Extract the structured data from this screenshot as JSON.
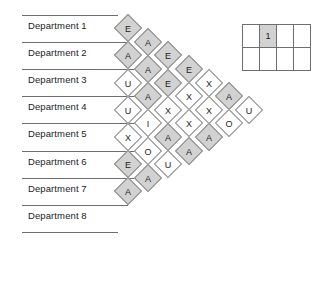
{
  "diagram": {
    "type": "activity-relationship-chart",
    "title": "",
    "departments": [
      {
        "label": "Department 1"
      },
      {
        "label": "Department 2"
      },
      {
        "label": "Department 3"
      },
      {
        "label": "Department 4"
      },
      {
        "label": "Department 5"
      },
      {
        "label": "Department 6"
      },
      {
        "label": "Department 7"
      },
      {
        "label": "Department 8"
      }
    ],
    "colors": {
      "shaded_cell": "#d2d2d2",
      "plain_cell": "#ffffff",
      "cell_border": "#8a8a8a",
      "rule": "#6e6e6e",
      "text": "#1c1c1c"
    },
    "columns": [
      {
        "index": 1,
        "offset": 1,
        "cells": [
          {
            "code": "E",
            "shaded": true,
            "pair": "1-2"
          },
          {
            "code": "A",
            "shaded": true,
            "pair": "2-3"
          },
          {
            "code": "U",
            "shaded": false,
            "pair": "3-4"
          },
          {
            "code": "U",
            "shaded": false,
            "pair": "4-5"
          },
          {
            "code": "X",
            "shaded": false,
            "pair": "5-6"
          },
          {
            "code": "E",
            "shaded": true,
            "pair": "6-7"
          },
          {
            "code": "A",
            "shaded": true,
            "pair": "7-8"
          }
        ]
      },
      {
        "index": 2,
        "offset": 2,
        "cells": [
          {
            "code": "A",
            "shaded": true,
            "pair": "1-3"
          },
          {
            "code": "A",
            "shaded": true,
            "pair": "2-4"
          },
          {
            "code": "A",
            "shaded": true,
            "pair": "3-5"
          },
          {
            "code": "I",
            "shaded": false,
            "pair": "4-6"
          },
          {
            "code": "O",
            "shaded": false,
            "pair": "5-7"
          },
          {
            "code": "A",
            "shaded": true,
            "pair": "6-8"
          }
        ]
      },
      {
        "index": 3,
        "offset": 3,
        "cells": [
          {
            "code": "E",
            "shaded": true,
            "pair": "1-4"
          },
          {
            "code": "E",
            "shaded": true,
            "pair": "2-5"
          },
          {
            "code": "X",
            "shaded": false,
            "pair": "3-6"
          },
          {
            "code": "A",
            "shaded": true,
            "pair": "4-7"
          },
          {
            "code": "U",
            "shaded": false,
            "pair": "5-8"
          }
        ]
      },
      {
        "index": 4,
        "offset": 4,
        "cells": [
          {
            "code": "E",
            "shaded": true,
            "pair": "1-5"
          },
          {
            "code": "X",
            "shaded": false,
            "pair": "2-6"
          },
          {
            "code": "X",
            "shaded": false,
            "pair": "3-7"
          },
          {
            "code": "A",
            "shaded": true,
            "pair": "4-8"
          }
        ]
      },
      {
        "index": 5,
        "offset": 5,
        "cells": [
          {
            "code": "X",
            "shaded": false,
            "pair": "1-6"
          },
          {
            "code": "X",
            "shaded": false,
            "pair": "2-7"
          },
          {
            "code": "A",
            "shaded": true,
            "pair": "3-8"
          }
        ]
      },
      {
        "index": 6,
        "offset": 6,
        "cells": [
          {
            "code": "A",
            "shaded": true,
            "pair": "1-7"
          },
          {
            "code": "O",
            "shaded": false,
            "pair": "2-8"
          }
        ]
      },
      {
        "index": 7,
        "offset": 7,
        "cells": [
          {
            "code": "U",
            "shaded": false,
            "pair": "1-8"
          }
        ]
      }
    ]
  },
  "legend": {
    "rows": [
      [
        {
          "value": "",
          "shaded": false
        },
        {
          "value": "1",
          "shaded": true
        },
        {
          "value": "",
          "shaded": false
        },
        {
          "value": "",
          "shaded": false
        }
      ],
      [
        {
          "value": "",
          "shaded": false
        },
        {
          "value": "",
          "shaded": false
        },
        {
          "value": "",
          "shaded": false
        },
        {
          "value": "",
          "shaded": false
        }
      ]
    ]
  }
}
